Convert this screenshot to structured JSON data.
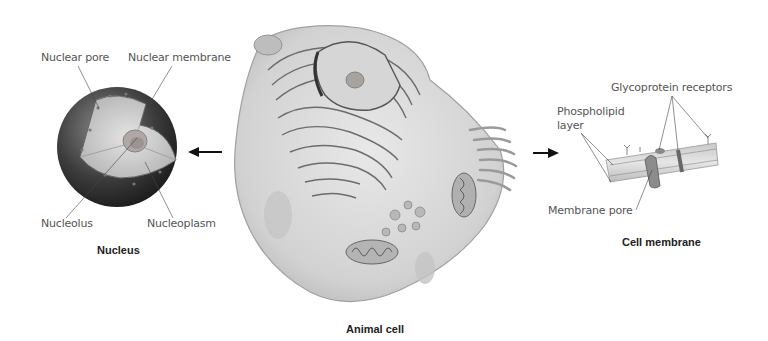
{
  "nucleus": {
    "caption": "Nucleus",
    "labels": {
      "nuclear_pore": "Nuclear pore",
      "nuclear_membrane": "Nuclear membrane",
      "nucleolus": "Nucleolus",
      "nucleoplasm": "Nucleoplasm"
    }
  },
  "animal_cell": {
    "caption": "Animal cell"
  },
  "cell_membrane": {
    "caption": "Cell membrane",
    "labels": {
      "glycoprotein_receptors": "Glycoprotein receptors",
      "phospholipid_layer_line1": "Phospholipid",
      "phospholipid_layer_line2": "layer",
      "membrane_pore": "Membrane pore"
    }
  },
  "arrows": {
    "left": "arrow-left",
    "right": "arrow-right"
  }
}
